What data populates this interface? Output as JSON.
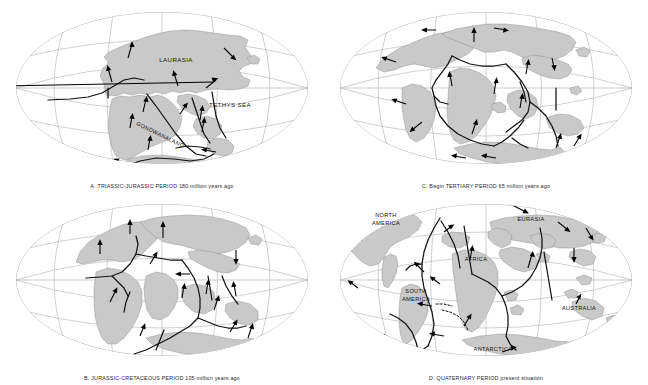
{
  "figure": {
    "background_color": "#ffffff",
    "land_color": "#c9c9c9",
    "land_stroke_color": "#8c8c8c",
    "graticule_color": "#a9a9a9",
    "boundary_color": "#111111",
    "arrow_color": "#000000",
    "projection": "mollweide",
    "panel_count": 4
  },
  "panels": [
    {
      "id": "panel-a",
      "code": "A.",
      "period": "TRIASSIC-JURASSIC PERIOD",
      "age": "180 million years ago",
      "caption": "A.  TRIASSIC-JURASSIC PERIOD  180 million years ago",
      "labels": [
        {
          "text": "LAURASIA",
          "x": 176,
          "y": 60
        },
        {
          "text": "TETHYS SEA",
          "x": 228,
          "y": 104
        },
        {
          "text": "GONDWANALAND",
          "x": 160,
          "y": 135
        }
      ]
    },
    {
      "id": "panel-b",
      "code": "B.",
      "period": "JURASSIC-CRETACEOUS PERIOD",
      "age": "135 million years ago",
      "caption": "B.  JURASSIC-CRETACEOUS PERIOD  135 million years ago",
      "labels": []
    },
    {
      "id": "panel-c",
      "code": "C.",
      "period": "Begin TERTIARY PERIOD",
      "age": "65 million years ago",
      "caption": "C.  Begin TERTIARY PERIOD  65 million years ago",
      "labels": []
    },
    {
      "id": "panel-d",
      "code": "D.",
      "period": "QUATERNARY PERIOD",
      "age": "present situation",
      "caption": "D.  QUATERNARY PERIOD  present situation",
      "labels": [
        {
          "text": "NORTH",
          "x": 62,
          "y": 24
        },
        {
          "text": "AMERICA",
          "x": 62,
          "y": 32
        },
        {
          "text": "EURASIA",
          "x": 207,
          "y": 28
        },
        {
          "text": "AFRICA",
          "x": 152,
          "y": 68
        },
        {
          "text": "SOUTH",
          "x": 92,
          "y": 100
        },
        {
          "text": "AMERICA",
          "x": 92,
          "y": 108
        },
        {
          "text": "AUSTRALIA",
          "x": 255,
          "y": 117
        },
        {
          "text": "ANTARCTICA",
          "x": 169,
          "y": 158
        }
      ]
    }
  ]
}
